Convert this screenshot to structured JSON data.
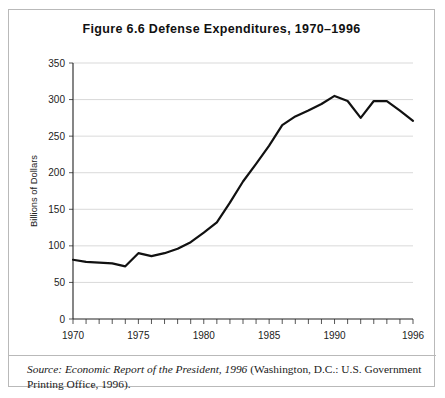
{
  "figure": {
    "title_prefix": "Figure",
    "title_number": "6.6",
    "title_text": "Defense Expenditures, 1970–1996",
    "title_full": "Figure 6.6   Defense Expenditures, 1970–1996",
    "border_color": "#b9b9b9",
    "background_color": "#ffffff"
  },
  "source": {
    "label": "Source:",
    "italic_part": "Economic Report of the President, 1996",
    "rest": " (Washington, D.C.: U.S. Government Printing Office, 1996).",
    "full_text": "Source: Economic Report of the President, 1996 (Washington, D.C.: U.S. Government Printing Office, 1996)."
  },
  "chart_data": {
    "type": "line",
    "title": "Figure 6.6   Defense Expenditures, 1970–1996",
    "xlabel": "",
    "ylabel": "Billions of Dollars",
    "xlim": [
      1970,
      1996
    ],
    "ylim": [
      0,
      350
    ],
    "grid": true,
    "grid_axis": "y",
    "legend": false,
    "line_color": "#111111",
    "x": [
      1970,
      1971,
      1972,
      1973,
      1974,
      1975,
      1976,
      1977,
      1978,
      1979,
      1980,
      1981,
      1982,
      1983,
      1984,
      1985,
      1986,
      1987,
      1988,
      1989,
      1990,
      1991,
      1992,
      1993,
      1994,
      1995,
      1996
    ],
    "values": [
      81,
      78,
      77,
      76,
      72,
      90,
      86,
      90,
      96,
      105,
      118,
      132,
      159,
      188,
      212,
      237,
      265,
      277,
      285,
      294,
      305,
      298,
      275,
      298,
      298,
      285,
      271
    ],
    "y_ticks": [
      0,
      50,
      100,
      150,
      200,
      250,
      300,
      350
    ],
    "y_tick_labels": [
      "0",
      "50",
      "100",
      "150",
      "200",
      "250",
      "300",
      "350"
    ],
    "x_ticks": [
      1970,
      1975,
      1980,
      1985,
      1990,
      1996
    ],
    "x_tick_labels": [
      "1970",
      "1975",
      "1980",
      "1985",
      "1990",
      "1996"
    ],
    "x_minor_ticks": [
      1970,
      1971,
      1972,
      1973,
      1974,
      1975,
      1976,
      1977,
      1978,
      1979,
      1980,
      1981,
      1982,
      1983,
      1984,
      1985,
      1986,
      1987,
      1988,
      1989,
      1990,
      1991,
      1992,
      1993,
      1994,
      1995,
      1996
    ]
  }
}
